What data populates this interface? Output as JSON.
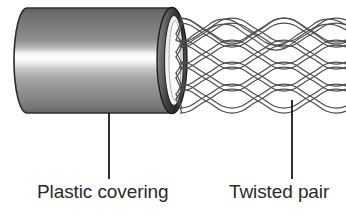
{
  "figure": {
    "background_color": "#ffffff"
  },
  "labels": {
    "plastic_covering": "Plastic covering",
    "twisted_pair": "Twisted pair"
  },
  "colors": {
    "line": "#1a1a1a",
    "text": "#2a2a2a",
    "jacket_top": "#6b6b6b",
    "jacket_highlight": "#ffffff",
    "jacket_mid": "#9c9c9c",
    "jacket_bottom": "#6e6e6e",
    "endcap_dark": "#3c3c3c",
    "endcap_inner": "#ffffff",
    "wire_stroke": "#555555"
  },
  "geometry": {
    "jacket": {
      "left_x": 14,
      "right_x": 176,
      "top_y": 8,
      "bottom_y": 113,
      "cap_rx": 13
    },
    "endcap": {
      "center_x": 176,
      "center_y": 60,
      "rx": 14,
      "ry": 53,
      "inner_rx": 8,
      "inner_ry": 42
    },
    "wire_pairs": 4,
    "wire_pair_center_y": [
      32,
      50,
      72,
      92
    ],
    "wire_region": {
      "start_x": 180,
      "end_x": 344
    },
    "leaders": [
      {
        "name": "plastic-covering-leader",
        "x": 109,
        "y1": 113,
        "y2": 179
      },
      {
        "name": "twisted-pair-leader",
        "x": 292,
        "y1": 100,
        "y2": 179
      }
    ]
  },
  "parts": [
    {
      "id": "plastic-covering",
      "label": "Plastic covering"
    },
    {
      "id": "twisted-pair",
      "label": "Twisted pair"
    }
  ]
}
